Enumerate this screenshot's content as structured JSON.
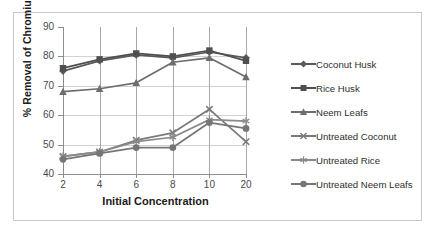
{
  "chart_data": {
    "type": "line",
    "title": "",
    "xlabel": "Initial Concentration",
    "ylabel": "% Removal of Chromium",
    "categories": [
      "2",
      "4",
      "6",
      "8",
      "10",
      "20"
    ],
    "ylim": [
      40,
      90
    ],
    "yticks": [
      "90",
      "80",
      "70",
      "60",
      "50",
      "40"
    ],
    "grid": true,
    "legend_position": "right",
    "series": [
      {
        "name": "Coconut Husk",
        "marker": "diamond",
        "color": "#5a5a5a",
        "values": [
          75.0,
          78.5,
          80.5,
          79.5,
          81.5,
          79.5
        ]
      },
      {
        "name": "Rice Husk",
        "marker": "square",
        "color": "#4f4f4f",
        "values": [
          76.0,
          79.0,
          81.0,
          80.0,
          82.0,
          78.5
        ]
      },
      {
        "name": "Neem Leafs",
        "marker": "triangle",
        "color": "#6e6e6e",
        "values": [
          68.0,
          69.0,
          71.0,
          78.0,
          79.5,
          73.0
        ]
      },
      {
        "name": "Untreated Coconut",
        "marker": "cross",
        "color": "#7a7a7a",
        "values": [
          46.0,
          47.5,
          51.5,
          54.0,
          62.0,
          51.0
        ]
      },
      {
        "name": "Untreated Rice",
        "marker": "asterisk",
        "color": "#8a8a8a",
        "values": [
          46.0,
          47.5,
          51.0,
          52.5,
          58.5,
          58.0
        ]
      },
      {
        "name": "Untreated Neem Leafs",
        "marker": "circle",
        "color": "#767676",
        "values": [
          45.0,
          47.0,
          49.0,
          49.0,
          57.5,
          55.5
        ]
      }
    ]
  },
  "colors": {
    "grid": "#d2d2d2",
    "axis": "#8d8d8d",
    "frame": "#c9c9c9",
    "text": "#2e2e2e",
    "background": "#ffffff"
  }
}
